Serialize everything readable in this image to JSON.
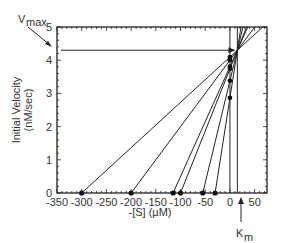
{
  "chart_data": {
    "type": "line",
    "title": "",
    "xlabel": "-[S] (µM)",
    "ylabel": "Initial Velocity (nM/sec)",
    "xlim": [
      -350,
      75
    ],
    "ylim": [
      0,
      5
    ],
    "x_ticks": [
      -350,
      -300,
      -250,
      -200,
      -150,
      -100,
      -50,
      0,
      50
    ],
    "y_ticks": [
      0,
      1,
      2,
      3,
      4,
      5
    ],
    "grid": false,
    "annotations": {
      "vmax_label": "V",
      "vmax_sub": "max",
      "km_label": "K",
      "km_sub": "m",
      "vmax": 4.3,
      "km": 15
    },
    "series": [
      {
        "name": "line1",
        "x_intercept": -300,
        "y_at_zero": 4.1
      },
      {
        "name": "line2",
        "x_intercept": -200,
        "y_at_zero": 4.0
      },
      {
        "name": "line3",
        "x_intercept": -115,
        "y_at_zero": 3.8
      },
      {
        "name": "line4",
        "x_intercept": -100,
        "y_at_zero": 3.75
      },
      {
        "name": "line5",
        "x_intercept": -55,
        "y_at_zero": 3.1
      },
      {
        "name": "line6",
        "x_intercept": -30,
        "y_at_zero": 2.6
      }
    ]
  }
}
